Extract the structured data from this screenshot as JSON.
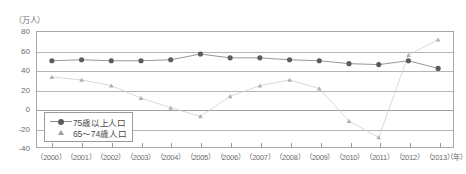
{
  "axes": {
    "y_unit_label": "（万人）",
    "x_unit_label": "（年）",
    "y_ticks": [
      "80",
      "60",
      "40",
      "20",
      "0",
      "-20",
      "-40"
    ],
    "x_ticks": [
      "（2000）",
      "（2001）",
      "（2002）",
      "（2003）",
      "（2004）",
      "（2005）",
      "（2006）",
      "（2007）",
      "（2008）",
      "（2009）",
      "（2010）",
      "（2011）",
      "（2012）",
      "（2013）"
    ]
  },
  "legend": {
    "items": [
      {
        "label": "75歳以上人口",
        "marker": "circle-line",
        "color": "#5c5c5c"
      },
      {
        "label": "65～74歳人口",
        "marker": "triangle",
        "color": "#9e9e9e"
      }
    ]
  },
  "chart_data": {
    "type": "line",
    "title": "",
    "subtitle": "",
    "xlabel": "（年）",
    "ylabel": "（万人）",
    "ylim": [
      -40,
      80
    ],
    "ytick_step": 20,
    "grid": true,
    "legend_position": "inside-bottom-left",
    "categories": [
      2000,
      2001,
      2002,
      2003,
      2004,
      2005,
      2006,
      2007,
      2008,
      2009,
      2010,
      2011,
      2012,
      2013
    ],
    "x": [
      "（2000）",
      "（2001）",
      "（2002）",
      "（2003）",
      "（2004）",
      "（2005）",
      "（2006）",
      "（2007）",
      "（2008）",
      "（2009）",
      "（2010）",
      "（2011）",
      "（2012）",
      "（2013）"
    ],
    "series": [
      {
        "name": "75歳以上人口",
        "color": "#5c5c5c",
        "marker": "circle",
        "values": [
          50,
          51,
          50,
          50,
          51,
          57,
          53,
          53,
          51,
          50,
          47,
          46,
          50,
          42
        ]
      },
      {
        "name": "65～74歳人口",
        "color": "#b0b0b0",
        "marker": "triangle",
        "values": [
          33,
          30,
          24,
          11,
          1,
          -8,
          13,
          24,
          30,
          21,
          -13,
          -30,
          56,
          72
        ]
      }
    ]
  }
}
